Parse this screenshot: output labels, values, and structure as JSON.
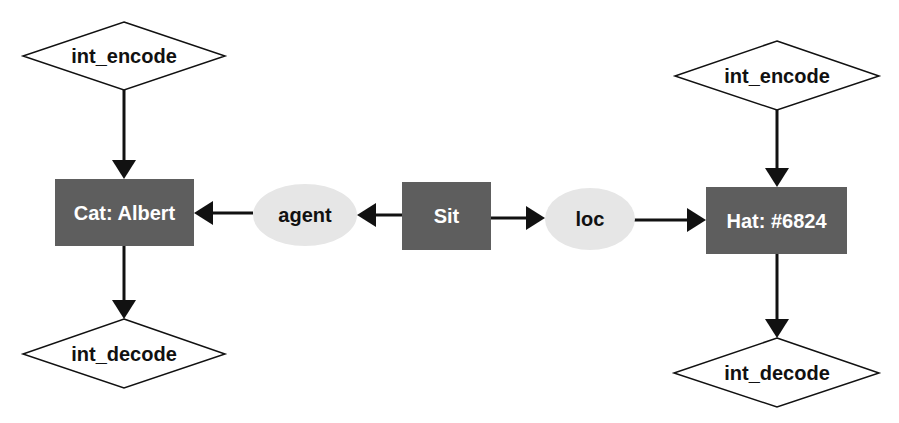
{
  "diagram": {
    "colors": {
      "box_fill": "#5e5e5e",
      "ellipse_fill": "#e6e6e6",
      "diamond_fill": "#ffffff",
      "stroke": "#111111",
      "box_text": "#ffffff",
      "text": "#111111"
    },
    "nodes": {
      "left_encode": {
        "label": "int_encode",
        "shape": "diamond"
      },
      "left_decode": {
        "label": "int_decode",
        "shape": "diamond"
      },
      "cat": {
        "label": "Cat: Albert",
        "shape": "rectangle"
      },
      "agent": {
        "label": "agent",
        "shape": "ellipse"
      },
      "sit": {
        "label": "Sit",
        "shape": "rectangle"
      },
      "loc": {
        "label": "loc",
        "shape": "ellipse"
      },
      "hat": {
        "label": "Hat: #6824",
        "shape": "rectangle"
      },
      "right_encode": {
        "label": "int_encode",
        "shape": "diamond"
      },
      "right_decode": {
        "label": "int_decode",
        "shape": "diamond"
      }
    },
    "edges": [
      {
        "from": "left_encode",
        "to": "cat"
      },
      {
        "from": "cat",
        "to": "left_decode"
      },
      {
        "from": "agent",
        "to": "cat"
      },
      {
        "from": "sit",
        "to": "agent"
      },
      {
        "from": "sit",
        "to": "loc"
      },
      {
        "from": "loc",
        "to": "hat"
      },
      {
        "from": "right_encode",
        "to": "hat"
      },
      {
        "from": "hat",
        "to": "right_decode"
      }
    ]
  }
}
